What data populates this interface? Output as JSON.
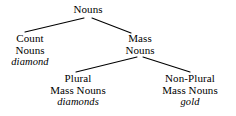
{
  "diagram": {
    "type": "tree",
    "background_color": "#ffffff",
    "line_color": "#000000",
    "text_color": "#000000"
  },
  "nodes": {
    "root": {
      "label": "Nouns",
      "example": "",
      "x": 88,
      "y": 10
    },
    "count_nouns": {
      "label_line1": "Count",
      "label_line2": "Nouns",
      "example": "diamond",
      "x": 30,
      "y": 39
    },
    "mass_nouns": {
      "label_line1": "Mass",
      "label_line2": "Nouns",
      "example": "",
      "x": 140,
      "y": 39
    },
    "plural_mass_nouns": {
      "label_line1": "Plural",
      "label_line2": "Mass Nouns",
      "example": "diamonds",
      "x": 78,
      "y": 79
    },
    "non_plural_mass_nouns": {
      "label_line1": "Non-Plural",
      "label_line2": "Mass Nouns",
      "example": "gold",
      "x": 190,
      "y": 79
    }
  },
  "edges": [
    {
      "from": "root",
      "to": "count_nouns",
      "x1": 84,
      "y1": 18,
      "x2": 25,
      "y2": 32
    },
    {
      "from": "root",
      "to": "mass_nouns",
      "x1": 92,
      "y1": 18,
      "x2": 131,
      "y2": 33
    },
    {
      "from": "mass_nouns",
      "to": "plural_mass_nouns",
      "x1": 137,
      "y1": 57,
      "x2": 76,
      "y2": 72
    },
    {
      "from": "mass_nouns",
      "to": "non_plural_mass_nouns",
      "x1": 143,
      "y1": 57,
      "x2": 190,
      "y2": 72
    }
  ]
}
